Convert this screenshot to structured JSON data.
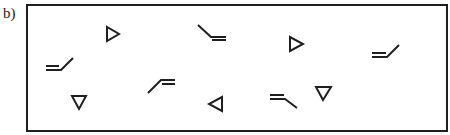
{
  "figure": {
    "panel_label": "b)",
    "stroke_color": "#1f1f1f",
    "background_color": "#ffffff",
    "symbols": [
      {
        "type": "triangle",
        "direction": "right",
        "x": 113,
        "y": 34
      },
      {
        "type": "hook",
        "variant": "backslash-equals",
        "x": 198,
        "y": 25
      },
      {
        "type": "triangle",
        "direction": "right",
        "x": 296,
        "y": 44
      },
      {
        "type": "hook",
        "variant": "equals-slash",
        "x": 372,
        "y": 45
      },
      {
        "type": "hook",
        "variant": "equals-slash",
        "x": 46,
        "y": 58
      },
      {
        "type": "hook",
        "variant": "slash-equals",
        "x": 148,
        "y": 77
      },
      {
        "type": "triangle",
        "direction": "down",
        "x": 79,
        "y": 102
      },
      {
        "type": "triangle",
        "direction": "left",
        "x": 215,
        "y": 104
      },
      {
        "type": "hook",
        "variant": "equals-backslash",
        "x": 270,
        "y": 92
      },
      {
        "type": "triangle",
        "direction": "down",
        "x": 323,
        "y": 93
      }
    ]
  }
}
